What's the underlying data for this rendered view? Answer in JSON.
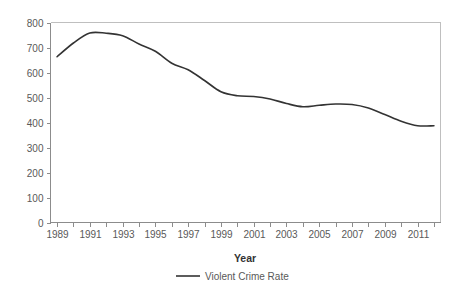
{
  "chart_data": {
    "type": "line",
    "title": "",
    "xlabel": "Year",
    "ylabel": "",
    "xlim": [
      1988.6,
      2012.4
    ],
    "ylim": [
      0,
      800
    ],
    "grid": false,
    "legend_position": "bottom-center",
    "x": [
      1989,
      1990,
      1991,
      1992,
      1993,
      1994,
      1995,
      1996,
      1997,
      1998,
      1999,
      2000,
      2001,
      2002,
      2003,
      2004,
      2005,
      2006,
      2007,
      2008,
      2009,
      2010,
      2011,
      2012
    ],
    "series": [
      {
        "name": "Violent Crime Rate",
        "color": "#333333",
        "values": [
          663,
          718,
          758,
          757,
          747,
          714,
          685,
          637,
          611,
          568,
          523,
          507,
          504,
          494,
          476,
          463,
          469,
          474,
          472,
          458,
          432,
          405,
          387,
          387
        ]
      }
    ],
    "y_ticks": [
      0,
      100,
      200,
      300,
      400,
      500,
      600,
      700,
      800
    ],
    "y_tick_labels": [
      "0",
      "100",
      "200",
      "300",
      "400",
      "500",
      "600",
      "700",
      "800"
    ],
    "x_major_ticks": [
      1989,
      1991,
      1993,
      1995,
      1997,
      1999,
      2001,
      2003,
      2005,
      2007,
      2009,
      2011
    ],
    "x_major_tick_labels": [
      "1989",
      "1991",
      "1993",
      "1995",
      "1997",
      "1999",
      "2001",
      "2003",
      "2005",
      "2007",
      "2009",
      "2011"
    ],
    "x_minor_ticks": [
      1990,
      1992,
      1994,
      1996,
      1998,
      2000,
      2002,
      2004,
      2006,
      2008,
      2010,
      2012
    ]
  },
  "legend": {
    "entries": [
      {
        "label": "Violent Crime Rate",
        "color": "#333333"
      }
    ]
  },
  "axes": {
    "x_title": "Year"
  },
  "colors": {
    "series": "#333333",
    "axis": "#8c8c8c",
    "frame": "#bfbfbf",
    "text": "#595959",
    "background": "#ffffff"
  }
}
